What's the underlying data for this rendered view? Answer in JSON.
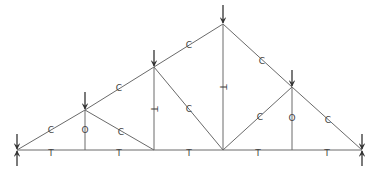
{
  "diagram": {
    "type": "roof-truss-force-diagram",
    "colors": {
      "member": "#6a6a6a",
      "load": "#333333",
      "label": "#444444",
      "background": "#ffffff"
    },
    "nodes": {
      "L": [
        17,
        150
      ],
      "B1": [
        85,
        150
      ],
      "B2": [
        154,
        150
      ],
      "B3": [
        223,
        150
      ],
      "B4": [
        292,
        150
      ],
      "R": [
        362,
        150
      ],
      "T1": [
        85,
        110
      ],
      "T2": [
        154,
        67
      ],
      "T3": [
        223,
        24
      ],
      "T4": [
        292,
        87
      ]
    },
    "members": [
      {
        "id": "top-chord-1",
        "from": "L",
        "to": "T1",
        "label": "C",
        "lx": 51,
        "ly": 130
      },
      {
        "id": "top-chord-2",
        "from": "T1",
        "to": "T2",
        "label": "C",
        "lx": 119,
        "ly": 88
      },
      {
        "id": "top-chord-3",
        "from": "T2",
        "to": "T3",
        "label": "C",
        "lx": 189,
        "ly": 45
      },
      {
        "id": "top-chord-4",
        "from": "T3",
        "to": "T4",
        "label": "C",
        "lx": 262,
        "ly": 61
      },
      {
        "id": "top-chord-5",
        "from": "T4",
        "to": "R",
        "label": "C",
        "lx": 328,
        "ly": 120
      },
      {
        "id": "bottom-chord-1",
        "from": "L",
        "to": "B1",
        "label": "T",
        "lx": 51,
        "ly": 153
      },
      {
        "id": "bottom-chord-2",
        "from": "B1",
        "to": "B2",
        "label": "T",
        "lx": 119,
        "ly": 153
      },
      {
        "id": "bottom-chord-3",
        "from": "B2",
        "to": "B3",
        "label": "T",
        "lx": 189,
        "ly": 153
      },
      {
        "id": "bottom-chord-4",
        "from": "B3",
        "to": "B4",
        "label": "T",
        "lx": 258,
        "ly": 153
      },
      {
        "id": "bottom-chord-5",
        "from": "B4",
        "to": "R",
        "label": "T",
        "lx": 327,
        "ly": 153
      },
      {
        "id": "vertical-1",
        "from": "T1",
        "to": "B1",
        "label": "O",
        "lx": 85,
        "ly": 130
      },
      {
        "id": "vertical-2",
        "from": "T2",
        "to": "B2",
        "label": "T",
        "lx": 154,
        "ly": 109,
        "rotate": 90
      },
      {
        "id": "vertical-3",
        "from": "T3",
        "to": "B3",
        "label": "T",
        "lx": 223,
        "ly": 87,
        "rotate": 90
      },
      {
        "id": "vertical-4",
        "from": "T4",
        "to": "B4",
        "label": "O",
        "lx": 292,
        "ly": 118
      },
      {
        "id": "diagonal-1",
        "from": "T1",
        "to": "B2",
        "label": "C",
        "lx": 121,
        "ly": 132
      },
      {
        "id": "diagonal-2",
        "from": "T2",
        "to": "B3",
        "label": "C",
        "lx": 189,
        "ly": 109
      },
      {
        "id": "diagonal-3",
        "from": "B3",
        "to": "T4",
        "label": "C",
        "lx": 260,
        "ly": 117
      }
    ],
    "loads": [
      {
        "id": "load-T1",
        "x": 85,
        "y1": 92,
        "y2": 110
      },
      {
        "id": "load-T2",
        "x": 154,
        "y1": 50,
        "y2": 67
      },
      {
        "id": "load-T3",
        "x": 223,
        "y1": 5,
        "y2": 24
      },
      {
        "id": "load-T4",
        "x": 292,
        "y1": 70,
        "y2": 87
      }
    ],
    "supports": [
      {
        "id": "support-left",
        "x": 17,
        "y": 150
      },
      {
        "id": "support-right",
        "x": 362,
        "y": 150
      }
    ],
    "legend": {
      "C": "compression",
      "T": "tension",
      "O": "zero-force"
    }
  }
}
